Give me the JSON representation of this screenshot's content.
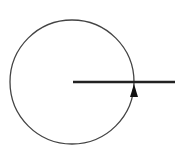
{
  "diagram": {
    "type": "circle-with-radius-and-direction-arrow",
    "circle": {
      "cx": 72,
      "cy": 82,
      "r": 62,
      "stroke": "#444444",
      "stroke_width": 1.3
    },
    "line": {
      "x1": 73,
      "y1": 82,
      "x2": 175,
      "y2": 82,
      "stroke": "#222222",
      "stroke_width": 2.6
    },
    "arrow": {
      "tip_x": 134,
      "tip_y": 84,
      "direction": "up",
      "fill": "#111111"
    },
    "labels": []
  }
}
